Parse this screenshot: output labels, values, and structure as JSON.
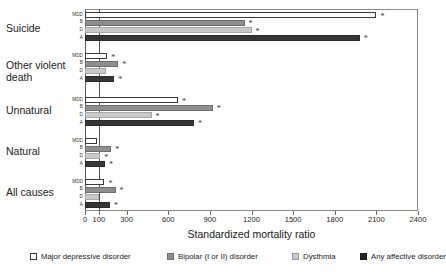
{
  "chart_data": {
    "type": "bar",
    "orientation": "horizontal",
    "title": "",
    "xlabel": "Standardized mortality ratio",
    "ylabel": "",
    "xlim": [
      0,
      2400
    ],
    "xticks": [
      0,
      100,
      300,
      600,
      900,
      1200,
      1500,
      1800,
      2100,
      2400
    ],
    "xticklabels": [
      "0",
      "100",
      "300",
      "600",
      "900",
      "1200",
      "1500",
      "1800",
      "2100",
      "2400"
    ],
    "grid": false,
    "reference_line": 100,
    "legend_position": "bottom",
    "categories": [
      "Suicide",
      "Other violent\ndeath",
      "Unnatural",
      "Natural",
      "All causes"
    ],
    "series_tick_labels": [
      "MDD",
      "B",
      "D",
      "A"
    ],
    "series": [
      {
        "name": "Major depressive disorder",
        "short": "MDD",
        "color": "#ffffff",
        "edge": "#3a3a3a",
        "values": [
          2100,
          160,
          670,
          90,
          140
        ],
        "significant": [
          true,
          true,
          true,
          false,
          true
        ]
      },
      {
        "name": "Bipolar (I or II) disorder",
        "short": "B",
        "color": "#8e8e8e",
        "edge": "#6d6d6d",
        "values": [
          1150,
          240,
          920,
          190,
          220
        ],
        "significant": [
          true,
          true,
          true,
          true,
          true
        ]
      },
      {
        "name": "Dysthmia",
        "short": "D",
        "color": "#c9c9c9",
        "edge": "#a8a8a8",
        "values": [
          1200,
          150,
          480,
          110,
          100
        ],
        "significant": [
          true,
          false,
          true,
          true,
          false
        ]
      },
      {
        "name": "Any affective disorder",
        "short": "A",
        "color": "#363636",
        "edge": "#2a2a2a",
        "values": [
          1980,
          210,
          785,
          145,
          180
        ],
        "significant": [
          true,
          true,
          true,
          true,
          true
        ]
      }
    ],
    "significance_marker": "*"
  },
  "legend": {
    "entries": [
      {
        "label": "Major depressive disorder",
        "swatch": "mdd"
      },
      {
        "label": "Bipolar (I or II) disorder",
        "swatch": "b"
      },
      {
        "label": "Dysthmia",
        "swatch": "d"
      },
      {
        "label": "Any affective disorder",
        "swatch": "a"
      }
    ]
  },
  "axis": {
    "xlabel": "Standardized mortality ratio"
  }
}
